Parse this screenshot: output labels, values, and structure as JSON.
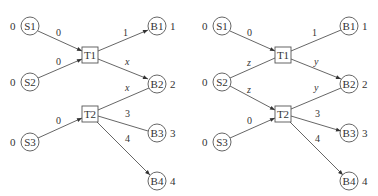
{
  "diagrams": [
    {
      "name": "left",
      "sources": [
        {
          "id": "S1",
          "label": "S1",
          "value": "0"
        },
        {
          "id": "S2",
          "label": "S2",
          "value": "0"
        },
        {
          "id": "S3",
          "label": "S3",
          "value": "0"
        }
      ],
      "transits": [
        {
          "id": "T1",
          "label": "T1"
        },
        {
          "id": "T2",
          "label": "T2"
        }
      ],
      "sinks": [
        {
          "id": "B1",
          "label": "B1",
          "value": "1"
        },
        {
          "id": "B2",
          "label": "B2",
          "value": "2"
        },
        {
          "id": "B3",
          "label": "B3",
          "value": "3"
        },
        {
          "id": "B4",
          "label": "B4",
          "value": "4"
        }
      ],
      "edges": [
        {
          "from": "S1",
          "to": "T1",
          "label": "0",
          "arrow": true
        },
        {
          "from": "S2",
          "to": "T1",
          "label": "0",
          "arrow": true
        },
        {
          "from": "T1",
          "to": "B1",
          "label": "1",
          "arrow": true
        },
        {
          "from": "T1",
          "to": "B2",
          "label": "x",
          "arrow": true
        },
        {
          "from": "T2",
          "to": "B2",
          "label": "x",
          "arrow": false
        },
        {
          "from": "S3",
          "to": "T2",
          "label": "0",
          "arrow": true
        },
        {
          "from": "T2",
          "to": "B3",
          "label": "3",
          "arrow": false
        },
        {
          "from": "T2",
          "to": "B4",
          "label": "4",
          "arrow": true
        }
      ]
    },
    {
      "name": "right",
      "sources": [
        {
          "id": "S1",
          "label": "S1",
          "value": "0"
        },
        {
          "id": "S2",
          "label": "S2",
          "value": "0"
        },
        {
          "id": "S3",
          "label": "S3",
          "value": "0"
        }
      ],
      "transits": [
        {
          "id": "T1",
          "label": "T1"
        },
        {
          "id": "T2",
          "label": "T2"
        }
      ],
      "sinks": [
        {
          "id": "B1",
          "label": "B1",
          "value": "1"
        },
        {
          "id": "B2",
          "label": "B2",
          "value": "2"
        },
        {
          "id": "B3",
          "label": "B3",
          "value": "3"
        },
        {
          "id": "B4",
          "label": "B4",
          "value": "4"
        }
      ],
      "edges": [
        {
          "from": "S1",
          "to": "T1",
          "label": "0",
          "arrow": true
        },
        {
          "from": "S2",
          "to": "T1",
          "label": "z",
          "arrow": false
        },
        {
          "from": "T1",
          "to": "B1",
          "label": "1",
          "arrow": false
        },
        {
          "from": "T1",
          "to": "B2",
          "label": "y",
          "arrow": true
        },
        {
          "from": "S2",
          "to": "T2",
          "label": "z",
          "arrow": true
        },
        {
          "from": "T2",
          "to": "B2",
          "label": "y",
          "arrow": false
        },
        {
          "from": "S3",
          "to": "T2",
          "label": "0",
          "arrow": true
        },
        {
          "from": "T2",
          "to": "B3",
          "label": "3",
          "arrow": true
        },
        {
          "from": "T2",
          "to": "B4",
          "label": "4",
          "arrow": true
        }
      ]
    }
  ]
}
